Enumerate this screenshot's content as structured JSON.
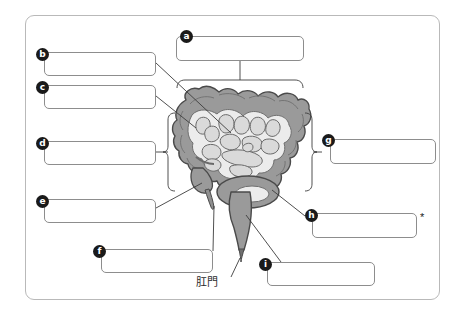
{
  "worksheet": {
    "title": "",
    "subject_diagram": "large-intestine",
    "frame": {
      "border_color": "#b9b9b9"
    },
    "star_marker": "*",
    "japanese_labels": [
      {
        "id": "anus",
        "text": "肛門",
        "x": 196,
        "y": 283
      }
    ],
    "answer_boxes": [
      {
        "key": "a",
        "label": "a",
        "value": "",
        "x": 176,
        "y": 36,
        "w": 128,
        "h": 25,
        "marker_x": 180,
        "marker_y": 30
      },
      {
        "key": "b",
        "label": "b",
        "value": "",
        "x": 44,
        "y": 52,
        "w": 112,
        "h": 24,
        "marker_x": 36,
        "marker_y": 48
      },
      {
        "key": "c",
        "label": "c",
        "value": "",
        "x": 44,
        "y": 85,
        "w": 112,
        "h": 24,
        "marker_x": 36,
        "marker_y": 81
      },
      {
        "key": "d",
        "label": "d",
        "value": "",
        "x": 44,
        "y": 141,
        "w": 112,
        "h": 24,
        "marker_x": 36,
        "marker_y": 137
      },
      {
        "key": "e",
        "label": "e",
        "value": "",
        "x": 44,
        "y": 199,
        "w": 112,
        "h": 24,
        "marker_x": 36,
        "marker_y": 195
      },
      {
        "key": "f",
        "label": "f",
        "value": "",
        "x": 101,
        "y": 249,
        "w": 112,
        "h": 24,
        "marker_x": 93,
        "marker_y": 245
      },
      {
        "key": "g",
        "label": "g",
        "value": "",
        "x": 330,
        "y": 139,
        "w": 106,
        "h": 25,
        "marker_x": 322,
        "marker_y": 134
      },
      {
        "key": "h",
        "label": "h",
        "value": "",
        "x": 312,
        "y": 213,
        "w": 105,
        "h": 25,
        "marker_x": 305,
        "marker_y": 209,
        "star_x": 420,
        "star_y": 212
      },
      {
        "key": "i",
        "label": "i",
        "value": "",
        "x": 267,
        "y": 262,
        "w": 108,
        "h": 24,
        "marker_x": 259,
        "marker_y": 258
      }
    ],
    "colors": {
      "colon_fill": "#9a9a9a",
      "colon_stroke": "#4a4a4a",
      "small_intestine_fill": "#dadada",
      "small_intestine_stroke": "#6a6a6a",
      "leader_line": "#3c3c3c",
      "box_border": "#8d8d8d",
      "marker_bg": "#1a1a1a",
      "marker_text": "#ffffff"
    },
    "diagram_parts": [
      {
        "name": "transverse-colon",
        "points_to": "a"
      },
      {
        "name": "ascending-colon-upper",
        "points_to": "b"
      },
      {
        "name": "ileum-junction",
        "points_to": "c"
      },
      {
        "name": "ascending-colon",
        "points_to": "d"
      },
      {
        "name": "cecum",
        "points_to": "e"
      },
      {
        "name": "appendix",
        "points_to": "f"
      },
      {
        "name": "descending-colon",
        "points_to": "g"
      },
      {
        "name": "sigmoid-colon",
        "points_to": "h"
      },
      {
        "name": "rectum",
        "points_to": "i"
      },
      {
        "name": "anus",
        "points_to": "anus"
      }
    ]
  }
}
